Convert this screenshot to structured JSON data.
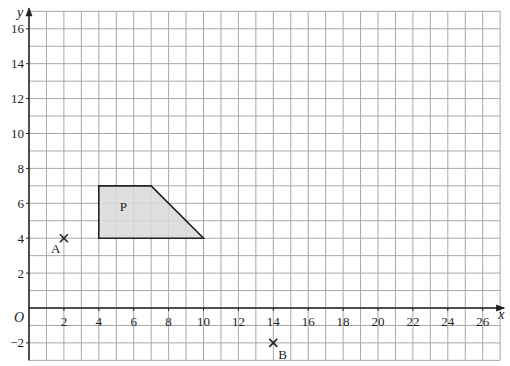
{
  "figure": {
    "x_axis_label": "x",
    "y_axis_label": "y",
    "origin_label": "O",
    "shape_label": "P",
    "point_a_label": "A",
    "point_b_label": "B",
    "colors": {
      "grid": "#a8a8a8",
      "axis": "#222222",
      "shape_fill": "#d9d9d9",
      "shape_stroke": "#222222"
    }
  },
  "chart_data": {
    "type": "scatter",
    "title": "",
    "xlabel": "x",
    "ylabel": "y",
    "xlim": [
      0,
      27
    ],
    "ylim": [
      -3,
      17
    ],
    "grid": true,
    "x_ticks": [
      2,
      4,
      6,
      8,
      10,
      12,
      14,
      16,
      18,
      20,
      22,
      24,
      26
    ],
    "y_ticks": [
      -2,
      2,
      4,
      6,
      8,
      10,
      12,
      14,
      16
    ],
    "shapes": [
      {
        "name": "P",
        "type": "polygon",
        "vertices": [
          [
            4,
            4
          ],
          [
            4,
            7
          ],
          [
            7,
            7
          ],
          [
            10,
            4
          ]
        ],
        "filled": true
      }
    ],
    "points": [
      {
        "name": "A",
        "x": 2,
        "y": 4,
        "marker": "x"
      },
      {
        "name": "B",
        "x": 14,
        "y": -2,
        "marker": "x"
      }
    ]
  }
}
